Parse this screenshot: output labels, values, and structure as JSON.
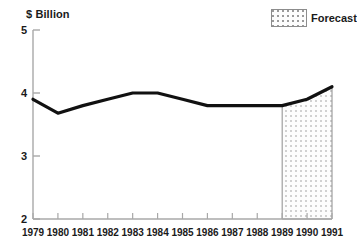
{
  "chart_data": {
    "type": "line",
    "title": "",
    "subtitle": "",
    "xlabel": "",
    "ylabel": "$ Billion",
    "ylim": [
      2,
      5
    ],
    "yticks": [
      2,
      3,
      4,
      5
    ],
    "ytick_labels": [
      "2",
      "3",
      "4",
      "5"
    ],
    "grid": false,
    "categories": [
      "1979",
      "1980",
      "1981",
      "1982",
      "1983",
      "1984",
      "1985",
      "1986",
      "1987",
      "1988",
      "1989",
      "1990",
      "1991"
    ],
    "x": [
      1979,
      1980,
      1981,
      1982,
      1983,
      1984,
      1985,
      1986,
      1987,
      1988,
      1989,
      1990,
      1991
    ],
    "values": [
      3.9,
      3.68,
      3.8,
      3.9,
      4.0,
      4.0,
      3.9,
      3.8,
      3.8,
      3.8,
      3.8,
      3.9,
      4.1
    ],
    "series": [
      {
        "name": "Value",
        "values": [
          3.9,
          3.68,
          3.8,
          3.9,
          4.0,
          4.0,
          3.9,
          3.8,
          3.8,
          3.8,
          3.8,
          3.9,
          4.1
        ],
        "color": "#111111"
      }
    ],
    "annotations": [
      {
        "type": "shaded-region",
        "label": "Forecast",
        "x_start": 1989,
        "x_end": 1991,
        "fill": "stipple"
      }
    ],
    "legend": {
      "position": "top-right",
      "entries": [
        {
          "label": "Forecast",
          "swatch": "stipple"
        }
      ]
    }
  },
  "axis": {
    "y_unit_prefix": "$",
    "y_unit_rest": "Billion"
  },
  "legend": {
    "forecast_label": "Forecast"
  },
  "colors": {
    "line": "#111111",
    "axis": "#a8a8a8",
    "text": "#1a1a1a",
    "stipple_border": "#8c8c8c",
    "stipple_dot": "#9a9a9a"
  }
}
